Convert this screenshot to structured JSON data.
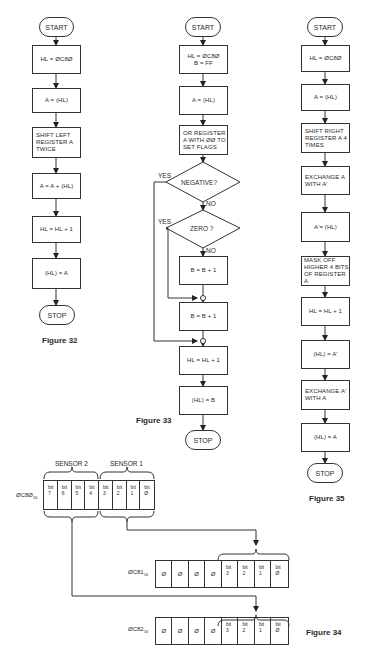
{
  "figure32": {
    "caption": "Figure 32",
    "start": "START",
    "steps": [
      "HL = ØC8Ø",
      "A = (HL)",
      "SHIFT LEFT REGISTER A TWICE",
      "A = A + (HL)",
      "HL = HL + 1",
      "(HL) = A"
    ],
    "stop": "STOP"
  },
  "figure33": {
    "caption": "Figure 33",
    "start": "START",
    "step1_line1": "HL = ØC8Ø",
    "step1_line2": "B = FF",
    "step2": "A = (HL)",
    "step3": "OR REGISTER A WITH ØØ TO SET FLAGS",
    "decision1": "NEGATIVE?",
    "decision2": "ZERO ?",
    "yes_label": "YES",
    "no_label": "NO",
    "step4": "B = B + 1",
    "step5": "B = B + 1",
    "step6": "HL = HL + 1",
    "step7": "(HL) = B",
    "stop": "STOP"
  },
  "figure35": {
    "caption": "Figure 35",
    "start": "START",
    "steps": [
      "HL = ØC8Ø",
      "A = (HL)",
      "SHIFT RIGHT REGISTER A 4 TIMES",
      "EXCHANGE A WITH A'",
      "A'= (HL)",
      "MASK OFF HIGHER 4 BITS OF REGISTER A",
      "HL = HL + 1",
      "(HL) = A'",
      "EXCHANGE A' WITH A",
      "(HL) = A"
    ],
    "stop": "STOP"
  },
  "figure34": {
    "caption": "Figure 34",
    "sensor2": "SENSOR 2",
    "sensor1": "SENSOR 1",
    "bit_word": "bit",
    "registers": [
      {
        "addr": "ØC8Ø",
        "base": "16",
        "cells": [
          "7",
          "6",
          "5",
          "4",
          "3",
          "2",
          "1",
          "Ø"
        ],
        "kinds": [
          "bit",
          "bit",
          "bit",
          "bit",
          "bit",
          "bit",
          "bit",
          "bit"
        ]
      },
      {
        "addr": "ØC81",
        "base": "16",
        "cells": [
          "Ø",
          "Ø",
          "Ø",
          "Ø",
          "3",
          "2",
          "1",
          "Ø"
        ],
        "kinds": [
          "zero",
          "zero",
          "zero",
          "zero",
          "bit",
          "bit",
          "bit",
          "bit"
        ]
      },
      {
        "addr": "ØC82",
        "base": "16",
        "cells": [
          "Ø",
          "Ø",
          "Ø",
          "Ø",
          "3",
          "2",
          "1",
          "Ø"
        ],
        "kinds": [
          "zero",
          "zero",
          "zero",
          "zero",
          "bit",
          "bit",
          "bit",
          "bit"
        ]
      }
    ]
  }
}
